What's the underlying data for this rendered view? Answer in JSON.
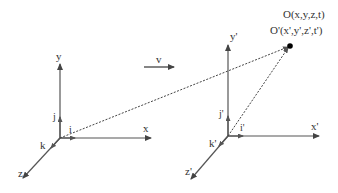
{
  "diagram": {
    "type": "reference-frames",
    "velocity_label": "v",
    "frame_s": {
      "axes": {
        "x": "x",
        "y": "y",
        "z": "z"
      },
      "unit_vectors": {
        "i": "i",
        "j": "j",
        "k": "k"
      }
    },
    "frame_s_prime": {
      "axes": {
        "x": "x'",
        "y": "y'",
        "z": "z'"
      },
      "unit_vectors": {
        "i": "i'",
        "j": "j'",
        "k": "k'"
      }
    },
    "event": {
      "label_s": "O(x,y,z,t)",
      "label_s_prime": "O'(x',y',z',t')"
    },
    "colors": {
      "axis": "#555555",
      "text": "#333333",
      "point": "#000000"
    }
  }
}
